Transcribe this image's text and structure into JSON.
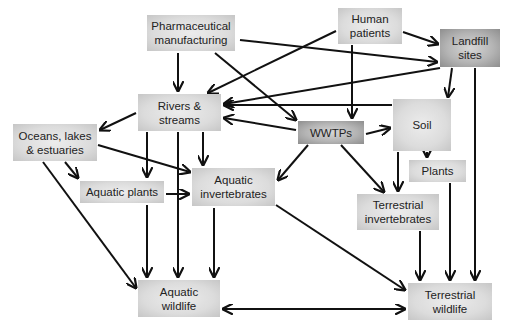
{
  "diagram": {
    "type": "flow",
    "nodes": [
      {
        "id": "pharma",
        "label": "Pharmaceutical\nmanufacturing",
        "x": 147,
        "y": 15,
        "w": 88,
        "h": 36,
        "style": "light"
      },
      {
        "id": "patients",
        "label": "Human\npatients",
        "x": 338,
        "y": 8,
        "w": 64,
        "h": 36,
        "style": "light"
      },
      {
        "id": "landfill",
        "label": "Landfill\nsites",
        "x": 440,
        "y": 29,
        "w": 60,
        "h": 36,
        "style": "dark"
      },
      {
        "id": "rivers",
        "label": "Rivers &\nstreams",
        "x": 138,
        "y": 94,
        "w": 83,
        "h": 36,
        "style": "light"
      },
      {
        "id": "oceans",
        "label": "Oceans, lakes\n& estuaries",
        "x": 13,
        "y": 124,
        "w": 84,
        "h": 36,
        "style": "light"
      },
      {
        "id": "wwtps",
        "label": "WWTPs",
        "x": 298,
        "y": 121,
        "w": 66,
        "h": 22,
        "style": "dark"
      },
      {
        "id": "soil",
        "label": "Soil",
        "x": 393,
        "y": 99,
        "w": 58,
        "h": 52,
        "style": "light"
      },
      {
        "id": "plants",
        "label": "Plants",
        "x": 409,
        "y": 160,
        "w": 57,
        "h": 22,
        "style": "light"
      },
      {
        "id": "aq_plants",
        "label": "Aquatic plants",
        "x": 80,
        "y": 180,
        "w": 84,
        "h": 22,
        "style": "light"
      },
      {
        "id": "aq_invert",
        "label": "Aquatic\ninvertebrates",
        "x": 192,
        "y": 168,
        "w": 83,
        "h": 38,
        "style": "light"
      },
      {
        "id": "terr_invert",
        "label": "Terrestrial\ninvertebrates",
        "x": 357,
        "y": 194,
        "w": 82,
        "h": 36,
        "style": "light"
      },
      {
        "id": "aq_wildlife",
        "label": "Aquatic\nwildlife",
        "x": 138,
        "y": 280,
        "w": 82,
        "h": 36,
        "style": "light"
      },
      {
        "id": "terr_wildlife",
        "label": "Terrestrial\nwildlife",
        "x": 408,
        "y": 283,
        "w": 84,
        "h": 36,
        "style": "light"
      }
    ],
    "edges": [
      {
        "from": "pharma",
        "to": "rivers"
      },
      {
        "from": "pharma",
        "to": "wwtps"
      },
      {
        "from": "pharma",
        "to": "landfill"
      },
      {
        "from": "patients",
        "to": "landfill"
      },
      {
        "from": "patients",
        "to": "rivers"
      },
      {
        "from": "patients",
        "to": "wwtps"
      },
      {
        "from": "landfill",
        "to": "rivers"
      },
      {
        "from": "landfill",
        "to": "soil"
      },
      {
        "from": "landfill",
        "to": "terr_wildlife"
      },
      {
        "from": "soil",
        "to": "rivers"
      },
      {
        "from": "soil",
        "to": "plants"
      },
      {
        "from": "soil",
        "to": "terr_invert"
      },
      {
        "from": "wwtps",
        "to": "rivers"
      },
      {
        "from": "wwtps",
        "to": "soil"
      },
      {
        "from": "wwtps",
        "to": "aq_invert"
      },
      {
        "from": "wwtps",
        "to": "terr_invert"
      },
      {
        "from": "rivers",
        "to": "oceans"
      },
      {
        "from": "rivers",
        "to": "aq_plants"
      },
      {
        "from": "rivers",
        "to": "aq_invert"
      },
      {
        "from": "rivers",
        "to": "aq_wildlife"
      },
      {
        "from": "oceans",
        "to": "aq_plants"
      },
      {
        "from": "oceans",
        "to": "aq_invert"
      },
      {
        "from": "oceans",
        "to": "aq_wildlife"
      },
      {
        "from": "aq_plants",
        "to": "aq_invert"
      },
      {
        "from": "aq_plants",
        "to": "aq_wildlife"
      },
      {
        "from": "aq_invert",
        "to": "aq_wildlife"
      },
      {
        "from": "aq_invert",
        "to": "terr_wildlife"
      },
      {
        "from": "plants",
        "to": "terr_wildlife"
      },
      {
        "from": "terr_invert",
        "to": "terr_wildlife"
      },
      {
        "from": "aq_wildlife",
        "to": "terr_wildlife",
        "bidirectional": true
      }
    ]
  }
}
